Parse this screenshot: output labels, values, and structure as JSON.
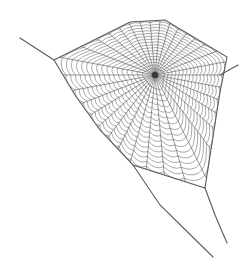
{
  "image": {
    "subject": "spider web illustration",
    "background": "#ffffff",
    "stroke_color": "#5a5a5a"
  },
  "web": {
    "hub": [
      155,
      75
    ],
    "frame_polygon": [
      [
        54,
        60
      ],
      [
        130,
        22
      ],
      [
        165,
        20
      ],
      [
        227,
        57
      ],
      [
        220,
        92
      ],
      [
        205,
        188
      ],
      [
        133,
        165
      ],
      [
        100,
        130
      ],
      [
        75,
        95
      ]
    ],
    "anchor_lines": [
      [
        [
          20,
          38
        ],
        [
          54,
          60
        ]
      ],
      [
        [
          220,
          75
        ],
        [
          238,
          65
        ]
      ],
      [
        [
          133,
          165
        ],
        [
          160,
          205
        ],
        [
          213,
          257
        ]
      ],
      [
        [
          205,
          188
        ],
        [
          215,
          215
        ],
        [
          227,
          243
        ]
      ]
    ],
    "radial_count": 34,
    "spiral_rings": 17
  }
}
